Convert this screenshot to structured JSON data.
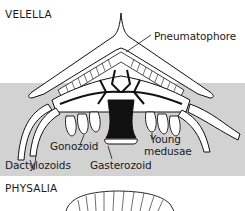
{
  "figure": {
    "sections": [
      {
        "title": "VELELLA"
      },
      {
        "title": "PHYSALIA"
      }
    ],
    "labels": {
      "pneumatophore": "Pneumatophore",
      "gonozoid": "Gonozoid",
      "young_medusae_1": "Young",
      "young_medusae_2": "medusae",
      "dactylozoids": "Dactylozoids",
      "gasterozoid": "Gasterozoid"
    },
    "colors": {
      "water_band": "#d2d2d2",
      "ink": "#111111",
      "paper": "#ffffff"
    }
  }
}
